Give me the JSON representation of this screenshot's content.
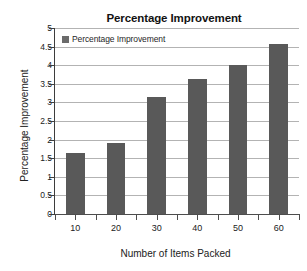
{
  "chart_data": {
    "type": "bar",
    "title": "Percentage Improvement",
    "xlabel": "Number of Items Packed",
    "ylabel": "Percentage Improvement",
    "categories": [
      "10",
      "20",
      "30",
      "40",
      "50",
      "60"
    ],
    "values": [
      1.65,
      1.9,
      3.15,
      3.62,
      4.0,
      4.57
    ],
    "series": [
      {
        "name": "Percentage Improvement",
        "values": [
          1.65,
          1.9,
          3.15,
          3.62,
          4.0,
          4.57
        ],
        "color": "#595959"
      }
    ],
    "ylim": [
      0,
      5
    ],
    "ytick_labels": [
      "5",
      "4.5",
      "4",
      "3.5",
      "3",
      "2.5",
      "2",
      "1.5",
      "1",
      "0.5",
      "0"
    ],
    "ytick_values": [
      5,
      4.5,
      4,
      3.5,
      3,
      2.5,
      2,
      1.5,
      1,
      0.5,
      0
    ],
    "grid": true,
    "legend": {
      "position": "top-left-inside",
      "entries": [
        {
          "label": "Percentage Improvement",
          "color": "#6b6b6b"
        }
      ]
    },
    "colors": {
      "bar": "#595959",
      "gridline": "#b3b3b3",
      "axis": "#4d4d4d",
      "text": "#222222",
      "background": "#ffffff"
    }
  }
}
